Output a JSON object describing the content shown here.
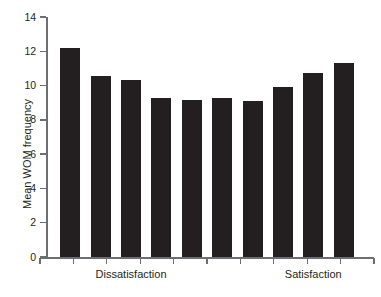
{
  "chart_data": {
    "type": "bar",
    "title": "",
    "subtitle": "",
    "xlabel": "",
    "ylabel": "Mean WOM frequency",
    "ylim": [
      0,
      14
    ],
    "ytick_step": 2,
    "yticks": [
      0,
      2,
      4,
      6,
      8,
      10,
      12,
      14
    ],
    "ytick_labels": [
      "0",
      "2",
      "4",
      "6",
      "8",
      "10",
      "12",
      "14"
    ],
    "grid": false,
    "legend": null,
    "bar_color": "#231f20",
    "axis_color": "#6d6e71",
    "categories": [
      "1",
      "2",
      "3",
      "4",
      "5",
      "6",
      "7",
      "8",
      "9",
      "10"
    ],
    "values": [
      12.2,
      10.55,
      10.35,
      9.25,
      9.15,
      9.25,
      9.1,
      9.9,
      10.75,
      11.3
    ],
    "annotations": [
      {
        "text": "Dissatisfaction",
        "near_category_index": 2
      },
      {
        "text": "Satisfaction",
        "near_category_index": 8
      }
    ],
    "x_axis_tick_count": 11
  },
  "axis": {
    "y_title": "Mean WOM frequency"
  },
  "x_labels": {
    "dissatisfaction": "Dissatisfaction",
    "satisfaction": "Satisfaction"
  }
}
